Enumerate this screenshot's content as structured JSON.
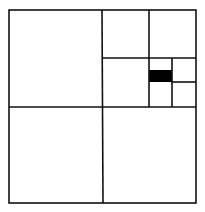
{
  "diagram": {
    "type": "quadtree-subdivision",
    "width": 205,
    "height": 212,
    "stroke_color": "#111111",
    "fill_color": "#000000",
    "background": "#ffffff",
    "stroke_width": 1.6,
    "outer": {
      "x1": 9,
      "y1": 10,
      "x2": 196,
      "y2": 203
    },
    "lines": [
      {
        "id": "mid-vertical",
        "x1": 102,
        "y1": 10,
        "x2": 103,
        "y2": 203
      },
      {
        "id": "mid-horizontal",
        "x1": 9,
        "y1": 107,
        "x2": 196,
        "y2": 107
      },
      {
        "id": "ur-vertical",
        "x1": 149,
        "y1": 10,
        "x2": 149,
        "y2": 107
      },
      {
        "id": "ur-horizontal",
        "x1": 102,
        "y1": 58,
        "x2": 196,
        "y2": 58
      },
      {
        "id": "lrs-vertical",
        "x1": 172,
        "y1": 58,
        "x2": 172,
        "y2": 107
      },
      {
        "id": "lrs-horizontal-right",
        "x1": 172,
        "y1": 82,
        "x2": 196,
        "y2": 82
      }
    ],
    "filled_cells": [
      {
        "id": "highlighted-cell",
        "x": 149,
        "y": 70,
        "width": 23,
        "height": 12
      }
    ]
  }
}
